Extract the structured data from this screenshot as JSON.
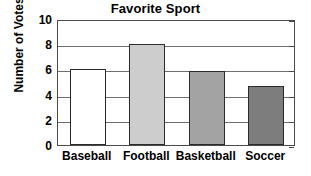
{
  "chart_data": {
    "type": "bar",
    "title": "Favorite Sport",
    "xlabel": "",
    "ylabel": "Number of Votes",
    "categories": [
      "Baseball",
      "Football",
      "Basketball",
      "Soccer"
    ],
    "values": [
      6,
      8,
      5.9,
      4.7
    ],
    "bar_colors": [
      "#ffffff",
      "#cdcdcd",
      "#a3a3a3",
      "#7d7d7d"
    ],
    "bar_edge_color": "#2b2b2b",
    "ylim": [
      0,
      10
    ],
    "ytick_values": [
      10,
      8,
      6,
      4,
      2,
      0
    ],
    "ytick_labels": [
      "10",
      "8",
      "6",
      "4",
      "2",
      "0"
    ],
    "grid": true,
    "grid_color": "#6e6e6e",
    "legend": null,
    "frame_color": "#4a4a4a",
    "background": "#ffffff"
  }
}
